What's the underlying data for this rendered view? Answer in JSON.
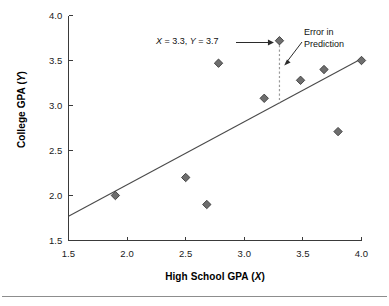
{
  "chart_data": {
    "type": "scatter",
    "title": "",
    "xlabel": "High School GPA (X)",
    "ylabel": "College GPA (Y)",
    "xlim": [
      1.5,
      4.0
    ],
    "ylim": [
      1.5,
      4.0
    ],
    "xticks": [
      "1.5",
      "2.0",
      "2.5",
      "3.0",
      "3.5",
      "4.0"
    ],
    "yticks": [
      "1.5",
      "2.0",
      "2.5",
      "3.0",
      "3.5",
      "4.0"
    ],
    "xtick_values": [
      1.5,
      2.0,
      2.5,
      3.0,
      3.5,
      4.0
    ],
    "ytick_values": [
      1.5,
      2.0,
      2.5,
      3.0,
      3.5,
      4.0
    ],
    "grid": false,
    "legend": "none",
    "marker": "diamond",
    "marker_color": "#6e6e6e",
    "marker_edge_color": "#3c3c3c",
    "points": [
      {
        "x": 1.9,
        "y": 2.0
      },
      {
        "x": 2.5,
        "y": 2.2
      },
      {
        "x": 2.68,
        "y": 1.9
      },
      {
        "x": 2.78,
        "y": 3.47
      },
      {
        "x": 3.17,
        "y": 3.08
      },
      {
        "x": 3.3,
        "y": 3.72,
        "highlight": true
      },
      {
        "x": 3.48,
        "y": 3.28
      },
      {
        "x": 3.68,
        "y": 3.4
      },
      {
        "x": 3.8,
        "y": 2.71
      },
      {
        "x": 4.0,
        "y": 3.5
      }
    ],
    "regression_line": {
      "x_start": 1.5,
      "y_start": 1.77,
      "x_end": 4.0,
      "y_end": 3.52,
      "color": "#4a4a4a"
    },
    "error_segment": {
      "x": 3.3,
      "y_top": 3.72,
      "y_bottom": 3.02,
      "style": "dashed",
      "color": "#9a9a9a"
    },
    "annotations": [
      {
        "name": "point-coordinates",
        "text_prefix": "X",
        "text": "X = 3.3, Y = 3.7",
        "x_value": 3.3,
        "y_value": 3.7,
        "has_arrow": true
      },
      {
        "name": "error-in-prediction",
        "line1": "Error in",
        "line2": "Prediction",
        "text": "Error in Prediction",
        "has_arrow": true
      }
    ]
  },
  "axes": {
    "ylabel_prefix": "College GPA (",
    "ylabel_var": "Y",
    "ylabel_suffix": ")",
    "xlabel_prefix": "High School GPA (",
    "xlabel_var": "X",
    "xlabel_suffix": ")"
  },
  "annotation_point": {
    "x_var": "X",
    "x_eq": " = 3.3, ",
    "y_var": "Y",
    "y_eq": " = 3.7"
  },
  "annotation_error": {
    "line1": "Error in",
    "line2": "Prediction"
  }
}
